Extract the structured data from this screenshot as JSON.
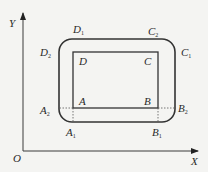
{
  "axes": {
    "x_label": "X",
    "y_label": "Y",
    "origin_label": "O"
  },
  "inner_rect": {
    "corners": [
      {
        "name": "A",
        "label": "A"
      },
      {
        "name": "B",
        "label": "B"
      },
      {
        "name": "C",
        "label": "C"
      },
      {
        "name": "D",
        "label": "D"
      }
    ]
  },
  "outer_rounded_rect": {
    "points": [
      {
        "base": "A",
        "sub": "1"
      },
      {
        "base": "A",
        "sub": "2"
      },
      {
        "base": "B",
        "sub": "1"
      },
      {
        "base": "B",
        "sub": "2"
      },
      {
        "base": "C",
        "sub": "1"
      },
      {
        "base": "C",
        "sub": "2"
      },
      {
        "base": "D",
        "sub": "1"
      },
      {
        "base": "D",
        "sub": "2"
      }
    ]
  },
  "colors": {
    "background": "#f4f4f2",
    "lines": "#333333"
  }
}
